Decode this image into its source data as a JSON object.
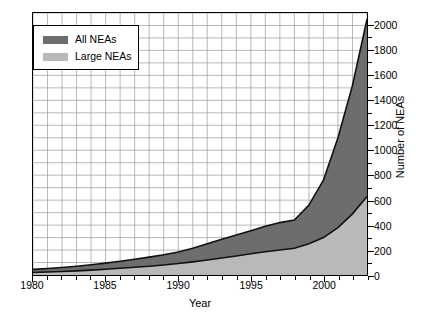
{
  "chart_data": {
    "type": "area",
    "title": "",
    "xlabel": "Year",
    "ylabel": "Number of NEAs",
    "xlim": [
      1980,
      2003
    ],
    "ylim": [
      0,
      2100
    ],
    "grid": true,
    "stacked": true,
    "x": [
      1980,
      1981,
      1982,
      1983,
      1984,
      1985,
      1986,
      1987,
      1988,
      1989,
      1990,
      1991,
      1992,
      1993,
      1994,
      1995,
      1996,
      1997,
      1998,
      1999,
      2000,
      2001,
      2002,
      2003
    ],
    "series": [
      {
        "name": "Large NEAs",
        "color": "#b9b9b9",
        "values": [
          20,
          24,
          28,
          33,
          39,
          46,
          54,
          62,
          70,
          80,
          92,
          105,
          120,
          136,
          152,
          170,
          186,
          200,
          214,
          250,
          300,
          380,
          490,
          630
        ]
      },
      {
        "name": "All NEAs",
        "color": "#6d6d6d",
        "values": [
          45,
          52,
          60,
          70,
          82,
          95,
          110,
          126,
          143,
          162,
          185,
          215,
          250,
          286,
          320,
          355,
          390,
          420,
          440,
          560,
          760,
          1100,
          1520,
          2050
        ]
      }
    ],
    "y_ticks": [
      0,
      200,
      400,
      600,
      800,
      1000,
      1200,
      1400,
      1600,
      1800,
      2000
    ],
    "y_minor_step": 100,
    "x_ticks": [
      1980,
      1985,
      1990,
      1995,
      2000
    ],
    "x_minor_step": 1,
    "legend": {
      "position": "top-left",
      "entries": [
        {
          "label": "All NEAs",
          "color": "#6d6d6d",
          "swatch": "dark-gray-swatch"
        },
        {
          "label": "Large NEAs",
          "color": "#b9b9b9",
          "swatch": "light-gray-swatch"
        }
      ]
    },
    "grid_color": "#9a9a9a",
    "axis_color": "#000000",
    "curve_color": "#111111"
  }
}
